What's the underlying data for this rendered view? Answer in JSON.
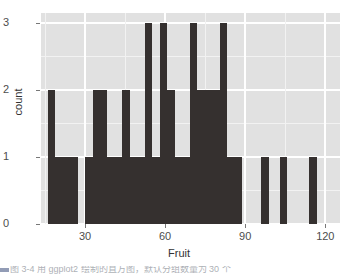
{
  "chart_data": {
    "type": "bar",
    "title": "",
    "subtitle": "",
    "xlabel": "Fruit",
    "ylabel": "count",
    "xlim": [
      13.5,
      125.5
    ],
    "ylim": [
      0,
      3.15
    ],
    "grid": true,
    "legend": null,
    "binwidth": 2.8,
    "x_ticks": [
      30,
      60,
      90,
      120
    ],
    "x_tick_labels": [
      "30",
      "60",
      "90",
      "120"
    ],
    "y_ticks": [
      0,
      1,
      2,
      3
    ],
    "y_tick_labels": [
      "0",
      "1",
      "2",
      "3"
    ],
    "bar_color": "#35302f",
    "panel_color": "#e1e1e1",
    "grid_color": "#ffffff",
    "axis_text_color": "#4d4d4d",
    "bins": [
      {
        "x0": 16.0,
        "x1": 18.8,
        "count": 2
      },
      {
        "x0": 18.8,
        "x1": 21.6,
        "count": 1
      },
      {
        "x0": 21.6,
        "x1": 24.4,
        "count": 1
      },
      {
        "x0": 24.4,
        "x1": 27.2,
        "count": 1
      },
      {
        "x0": 30.0,
        "x1": 32.8,
        "count": 1
      },
      {
        "x0": 32.8,
        "x1": 35.6,
        "count": 2
      },
      {
        "x0": 35.6,
        "x1": 38.4,
        "count": 2
      },
      {
        "x0": 38.4,
        "x1": 41.2,
        "count": 1
      },
      {
        "x0": 41.2,
        "x1": 44.0,
        "count": 1
      },
      {
        "x0": 44.0,
        "x1": 46.8,
        "count": 2
      },
      {
        "x0": 46.8,
        "x1": 49.6,
        "count": 1
      },
      {
        "x0": 49.6,
        "x1": 52.4,
        "count": 1
      },
      {
        "x0": 52.4,
        "x1": 55.2,
        "count": 3
      },
      {
        "x0": 55.2,
        "x1": 58.0,
        "count": 1
      },
      {
        "x0": 58.0,
        "x1": 60.8,
        "count": 3
      },
      {
        "x0": 60.8,
        "x1": 63.6,
        "count": 2
      },
      {
        "x0": 63.6,
        "x1": 66.4,
        "count": 1
      },
      {
        "x0": 66.4,
        "x1": 69.2,
        "count": 1
      },
      {
        "x0": 69.2,
        "x1": 72.0,
        "count": 3
      },
      {
        "x0": 72.0,
        "x1": 74.8,
        "count": 2
      },
      {
        "x0": 74.8,
        "x1": 77.6,
        "count": 2
      },
      {
        "x0": 77.6,
        "x1": 80.4,
        "count": 2
      },
      {
        "x0": 80.4,
        "x1": 83.2,
        "count": 3
      },
      {
        "x0": 83.2,
        "x1": 86.0,
        "count": 1
      },
      {
        "x0": 86.0,
        "x1": 88.8,
        "count": 1
      },
      {
        "x0": 96.0,
        "x1": 98.8,
        "count": 1
      },
      {
        "x0": 103.0,
        "x1": 105.8,
        "count": 1
      },
      {
        "x0": 114.0,
        "x1": 116.8,
        "count": 1
      }
    ]
  },
  "caption": {
    "text": "图 3-4  用 ggplot2 绘制的直方图，默认分组数量为 30 个"
  }
}
